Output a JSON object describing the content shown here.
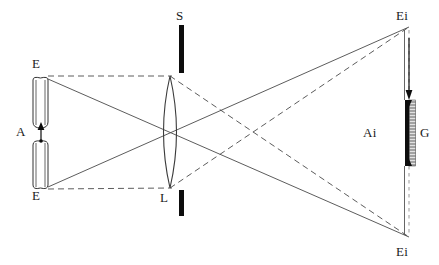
{
  "figure": {
    "type": "optical-ray-diagram",
    "background_color": "#ffffff",
    "line_color": "#4a4a4a",
    "stop_color": "#0d0d0d"
  },
  "labels": {
    "object_top": "E",
    "object_bottom": "E",
    "object_arrow": "A",
    "stop_top": "S",
    "lens": "L",
    "image_top": "Ei",
    "image_bottom": "Ei",
    "image_arrow": "Ai",
    "grating": "G"
  },
  "elements": {
    "object_top_cylinder": {
      "x": 33,
      "y": 77,
      "width": 15,
      "height": 50
    },
    "object_bottom_cylinder": {
      "x": 33,
      "y": 139,
      "width": 15,
      "height": 50
    },
    "object_arrow": {
      "x": 41,
      "y_top": 125,
      "y_bottom": 143,
      "direction": "up"
    },
    "lens": {
      "center_x": 170,
      "top_y": 76,
      "bottom_y": 188,
      "half_width": 13
    },
    "stop_upper": {
      "x": 181,
      "y_top": 25,
      "y_bottom": 73,
      "width": 5
    },
    "stop_lower": {
      "x": 181,
      "y_top": 190,
      "y_bottom": 215,
      "width": 5
    },
    "image_plane_x": 409,
    "image_top_point": {
      "x": 409,
      "y": 27
    },
    "image_bottom_point": {
      "x": 409,
      "y": 237
    },
    "grating_bar": {
      "x": 409,
      "y_top": 100,
      "y_bottom": 166,
      "width": 7
    }
  },
  "rays": {
    "solid": [
      {
        "from": [
          48,
          79
        ],
        "to": [
          409,
          237
        ]
      },
      {
        "from": [
          48,
          187
        ],
        "to": [
          409,
          27
        ]
      },
      {
        "from": [
          48,
          79
        ],
        "to": [
          170,
          188
        ]
      },
      {
        "from": [
          48,
          187
        ],
        "to": [
          170,
          76
        ]
      }
    ],
    "dashed": [
      {
        "from": [
          48,
          76
        ],
        "to": [
          170,
          76
        ]
      },
      {
        "from": [
          48,
          189
        ],
        "to": [
          170,
          188
        ]
      },
      {
        "from": [
          170,
          76
        ],
        "to": [
          409,
          237
        ]
      },
      {
        "from": [
          170,
          188
        ],
        "to": [
          409,
          27
        ]
      }
    ]
  }
}
